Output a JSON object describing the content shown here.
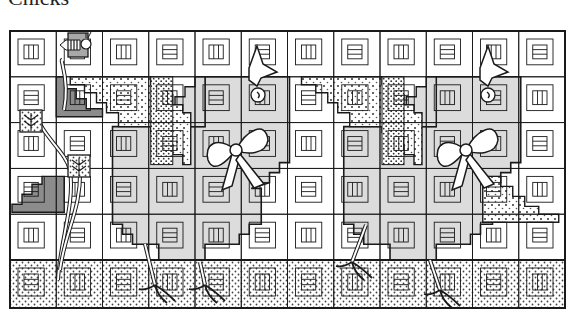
{
  "title": "Chicks",
  "colors": {
    "line": "#1a1a1a",
    "chick_fill": "#dcdcdc",
    "dark_fill": "#8c8c8c",
    "bee_fill": "#a8a8a8",
    "background": "#ffffff"
  },
  "grid": {
    "left": 10,
    "top": 31,
    "block_w": 46.25,
    "block_h": 45.8,
    "cols": 12,
    "rows": 5,
    "border_row_h": 48
  },
  "elements": {
    "bee": "bee-appliqué",
    "flower_stems": "stems-with-leaves",
    "chicks": [
      "chick-left",
      "chick-right"
    ],
    "bows": [
      "bow-left",
      "bow-right"
    ],
    "border": "dotted-border-row"
  }
}
